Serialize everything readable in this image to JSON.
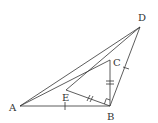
{
  "diagram": {
    "type": "geometry",
    "points": {
      "A": {
        "label": "A",
        "x": 20,
        "y": 106
      },
      "B": {
        "label": "B",
        "x": 110,
        "y": 106
      },
      "C": {
        "label": "C",
        "x": 110,
        "y": 60
      },
      "D": {
        "label": "D",
        "x": 140,
        "y": 27
      },
      "E": {
        "label": "E",
        "x": 66,
        "y": 90
      }
    },
    "segments": [
      "AB",
      "AD",
      "AC",
      "ED",
      "EB",
      "BC",
      "BD"
    ],
    "marks": {
      "single_tick": [
        "AB",
        "BD"
      ],
      "double_tick": [
        "EB",
        "BC"
      ],
      "right_angle": "EBC"
    },
    "colors": {
      "line": "#333333",
      "label": "#333333",
      "background": "#ffffff"
    }
  }
}
